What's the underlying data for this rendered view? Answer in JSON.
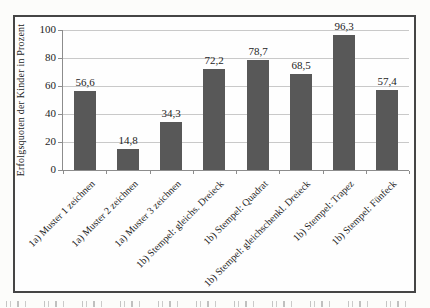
{
  "chart_data": {
    "type": "bar",
    "title": "",
    "xlabel": "",
    "ylabel": "Erfolgsquoten der Kinder in Prozent",
    "categories": [
      "1a) Muster 1 zeichnen",
      "1a) Muster 2 zeichnen",
      "1a) Muster 3 zeichnen",
      "1b) Stempel: gleichs. Dreieck",
      "1b) Stempel: Quadrat",
      "1b) Stempel: gleichschenkl. Dreieck",
      "1b) Stempel: Trapez",
      "1b) Stempel: Fünfeck"
    ],
    "values": [
      56.6,
      14.8,
      34.3,
      72.2,
      78.7,
      68.5,
      96.3,
      57.4
    ],
    "value_labels": [
      "56,6",
      "14,8",
      "34,3",
      "72,2",
      "78,7",
      "68,5",
      "96,3",
      "57,4"
    ],
    "ylim": [
      0,
      100
    ],
    "yticks": [
      0,
      20,
      40,
      60,
      80,
      100
    ],
    "ytick_labels": [
      "0",
      "20",
      "40",
      "60",
      "80",
      "100"
    ],
    "grid": "horizontal",
    "legend": "none"
  },
  "colors": {
    "bar": "#585858",
    "gridline": "#c9c9c9",
    "axis": "#8c8c8c",
    "frame_border": "#454545",
    "text": "#1d1d1d",
    "background": "#fcfcfa"
  }
}
